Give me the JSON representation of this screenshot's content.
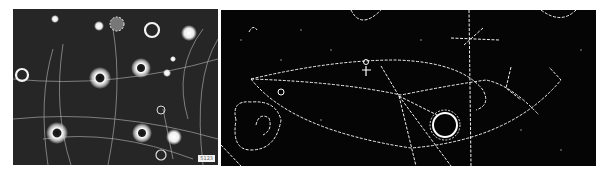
{
  "figure": {
    "panels": [
      {
        "id": "left",
        "description": "bubble chamber photograph with bright ring-shaped fiducial marks and particle tracks",
        "corner_label": "5123",
        "background": "#262626",
        "track_color": "#e8e8e8"
      },
      {
        "id": "right",
        "description": "bubble chamber photograph (high contrast) showing curved dotted particle tracks, vertex and fiducial rings",
        "background": "#050505",
        "track_color": "#f0f0f0"
      }
    ]
  }
}
